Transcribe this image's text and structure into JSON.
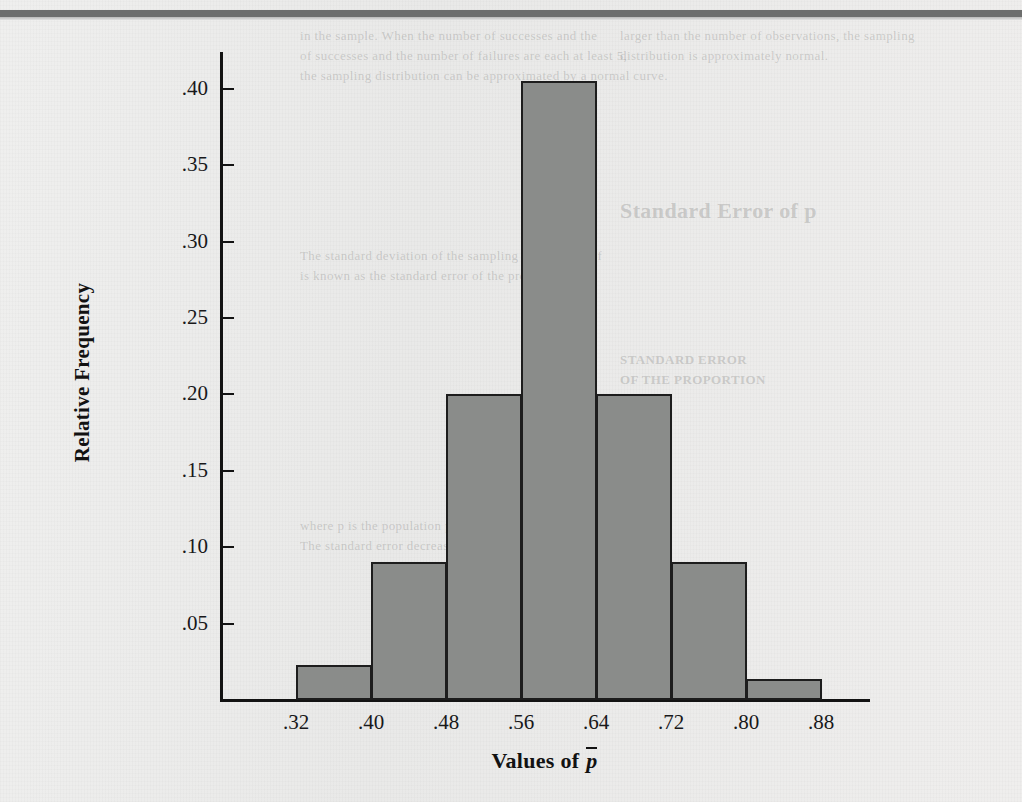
{
  "page": {
    "background_color": "#ececeb",
    "top_rule_color": "#6d6e6d"
  },
  "ghost_text": [
    {
      "text": "in the sample. When the number of successes and the",
      "x": 300,
      "y": 28,
      "size": 13,
      "bold": false
    },
    {
      "text": "larger than the number of observations, the sampling",
      "x": 620,
      "y": 28,
      "size": 13,
      "bold": false
    },
    {
      "text": "distribution is approximately normal.",
      "x": 620,
      "y": 48,
      "size": 13,
      "bold": false
    },
    {
      "text": "of successes and the number of failures are each at least 5,",
      "x": 300,
      "y": 48,
      "size": 13,
      "bold": false
    },
    {
      "text": "the sampling distribution can be approximated by a normal curve.",
      "x": 300,
      "y": 68,
      "size": 13,
      "bold": false
    },
    {
      "text": "Standard Error of p",
      "x": 620,
      "y": 198,
      "size": 22,
      "bold": true
    },
    {
      "text": "The standard deviation of the sampling distribution of",
      "x": 300,
      "y": 248,
      "size": 13,
      "bold": false
    },
    {
      "text": "is known as the standard error of the proportion.",
      "x": 300,
      "y": 268,
      "size": 13,
      "bold": false
    },
    {
      "text": "STANDARD ERROR",
      "x": 620,
      "y": 352,
      "size": 13,
      "bold": true
    },
    {
      "text": "OF THE PROPORTION",
      "x": 620,
      "y": 372,
      "size": 13,
      "bold": true
    },
    {
      "text": "where p is the population proportion and n is the sample size.",
      "x": 300,
      "y": 518,
      "size": 13,
      "bold": false
    },
    {
      "text": "The standard error decreases as the sample size increases.",
      "x": 300,
      "y": 538,
      "size": 13,
      "bold": false
    }
  ],
  "chart_data": {
    "type": "bar",
    "title": "",
    "xlabel": "Values of p̄",
    "ylabel": "Relative Frequency",
    "xlim": [
      0.28,
      0.92
    ],
    "ylim": [
      0.0,
      0.45
    ],
    "grid": false,
    "legend": null,
    "bin_width": 0.08,
    "x_tick_labels": [
      ".32",
      ".40",
      ".48",
      ".56",
      ".64",
      ".72",
      ".80",
      ".88"
    ],
    "x_tick_values": [
      0.32,
      0.4,
      0.48,
      0.56,
      0.64,
      0.72,
      0.8,
      0.88
    ],
    "y_tick_labels": [
      ".05",
      ".10",
      ".15",
      ".20",
      ".25",
      ".30",
      ".35",
      ".40"
    ],
    "y_tick_values": [
      0.05,
      0.1,
      0.15,
      0.2,
      0.25,
      0.3,
      0.35,
      0.4
    ],
    "bars": [
      {
        "bin_start": 0.32,
        "bin_end": 0.4,
        "value": 0.023
      },
      {
        "bin_start": 0.4,
        "bin_end": 0.48,
        "value": 0.09
      },
      {
        "bin_start": 0.48,
        "bin_end": 0.56,
        "value": 0.2
      },
      {
        "bin_start": 0.56,
        "bin_end": 0.64,
        "value": 0.405
      },
      {
        "bin_start": 0.64,
        "bin_end": 0.72,
        "value": 0.2
      },
      {
        "bin_start": 0.72,
        "bin_end": 0.8,
        "value": 0.09
      },
      {
        "bin_start": 0.8,
        "bin_end": 0.88,
        "value": 0.014
      }
    ],
    "categories": [
      ".32-.40",
      ".40-.48",
      ".48-.56",
      ".56-.64",
      ".64-.72",
      ".72-.80",
      ".80-.88"
    ],
    "values": [
      0.023,
      0.09,
      0.2,
      0.405,
      0.2,
      0.09,
      0.014
    ],
    "bar_fill_color": "#8a8c8a",
    "bar_edge_color": "#1d1d1d",
    "axis_color": "#131313"
  },
  "geometry": {
    "origin_x": 221,
    "baseline_y": 700,
    "px_per_bin": 75,
    "px_per_unit_y": 1528
  }
}
